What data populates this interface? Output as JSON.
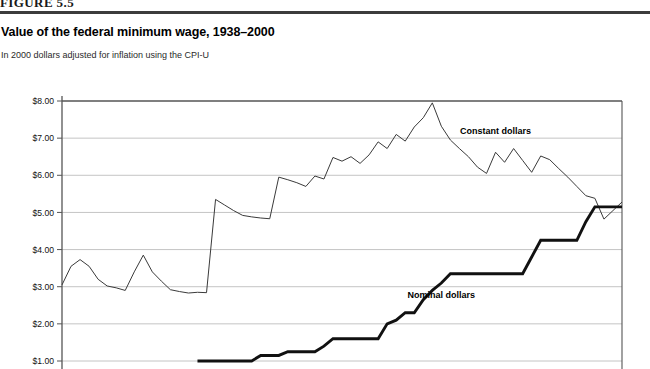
{
  "figure": {
    "number_label": "FIGURE 5.5",
    "title": "Value of the federal minimum wage, 1938–2000",
    "subtitle": "In 2000 dollars adjusted for inflation using the CPI-U"
  },
  "axis": {
    "y_tick_labels": [
      "$8.00",
      "$7.00",
      "$6.00",
      "$5.00",
      "$4.00",
      "$3.00",
      "$2.00",
      "$1.00"
    ],
    "y_tick_values": [
      8,
      7,
      6,
      5,
      4,
      3,
      2,
      1
    ]
  },
  "series_labels": {
    "constant": "Constant dollars",
    "nominal": "Nominal dollars"
  },
  "colors": {
    "constant_line": "#3a3a3a",
    "nominal_line": "#111111",
    "gridline": "#bdbdbd",
    "axis": "#555555",
    "header_rule": "#3c3c3c",
    "background": "#ffffff"
  },
  "chart_data": {
    "type": "line",
    "title": "Value of the federal minimum wage, 1938–2000",
    "subtitle": "In 2000 dollars adjusted for inflation using the CPI-U",
    "xlabel": "",
    "ylabel": "",
    "ylim": [
      1.0,
      8.0
    ],
    "xlim": [
      1938,
      2000
    ],
    "grid": true,
    "legend": "inline-annotations",
    "x": [
      1938,
      1939,
      1940,
      1941,
      1942,
      1943,
      1944,
      1945,
      1946,
      1947,
      1948,
      1949,
      1950,
      1951,
      1952,
      1953,
      1954,
      1955,
      1956,
      1957,
      1958,
      1959,
      1960,
      1961,
      1962,
      1963,
      1964,
      1965,
      1966,
      1967,
      1968,
      1969,
      1970,
      1971,
      1972,
      1973,
      1974,
      1975,
      1976,
      1977,
      1978,
      1979,
      1980,
      1981,
      1982,
      1983,
      1984,
      1985,
      1986,
      1987,
      1988,
      1989,
      1990,
      1991,
      1992,
      1993,
      1994,
      1995,
      1996,
      1997,
      1998,
      1999,
      2000
    ],
    "series": [
      {
        "name": "Constant dollars",
        "units": "2000 dollars",
        "values": [
          3.05,
          3.55,
          3.73,
          3.55,
          3.2,
          3.02,
          2.97,
          2.9,
          3.4,
          3.85,
          3.4,
          3.15,
          2.92,
          2.87,
          2.83,
          2.85,
          2.84,
          5.35,
          5.2,
          5.05,
          4.92,
          4.88,
          4.85,
          4.83,
          5.95,
          5.88,
          5.8,
          5.7,
          5.98,
          5.9,
          6.48,
          6.38,
          6.5,
          6.32,
          6.55,
          6.9,
          6.72,
          7.1,
          6.92,
          7.3,
          7.55,
          7.95,
          7.32,
          6.95,
          6.72,
          6.5,
          6.22,
          6.05,
          6.62,
          6.35,
          6.72,
          6.4,
          6.08,
          6.52,
          6.42,
          6.18,
          5.95,
          5.7,
          5.45,
          5.38,
          4.82,
          5.05,
          5.28
        ],
        "style": "thin-line"
      },
      {
        "name": "Nominal dollars",
        "units": "current dollars",
        "values": [
          null,
          null,
          null,
          null,
          null,
          null,
          null,
          null,
          null,
          null,
          null,
          null,
          null,
          null,
          null,
          1.0,
          1.0,
          1.0,
          1.0,
          1.0,
          1.0,
          1.0,
          1.15,
          1.15,
          1.15,
          1.25,
          1.25,
          1.25,
          1.25,
          1.4,
          1.6,
          1.6,
          1.6,
          1.6,
          1.6,
          1.6,
          2.0,
          2.1,
          2.3,
          2.3,
          2.65,
          2.9,
          3.1,
          3.35,
          3.35,
          3.35,
          3.35,
          3.35,
          3.35,
          3.35,
          3.35,
          3.35,
          3.8,
          4.25,
          4.25,
          4.25,
          4.25,
          4.25,
          4.75,
          5.15,
          5.15,
          5.15,
          5.15
        ],
        "style": "thick-line"
      }
    ],
    "annotations": [
      {
        "text": "Constant dollars",
        "x": 1986,
        "y": 7.1
      },
      {
        "text": "Nominal dollars",
        "x": 1980,
        "y": 2.7
      }
    ]
  }
}
